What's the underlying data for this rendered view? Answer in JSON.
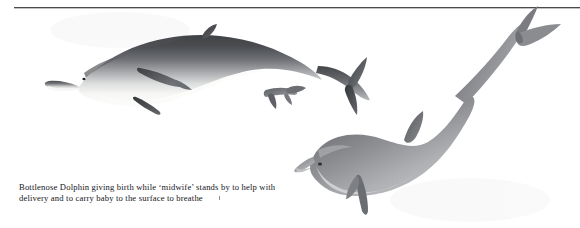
{
  "page": {
    "background_color": "#ffffff",
    "width": 580,
    "height": 228,
    "kind": "book-illustration-plate"
  },
  "rule": {
    "name": "horizontal-rule",
    "color": "#4a4a4a"
  },
  "caption": {
    "line1": "Bottlenose Dolphin giving birth while ‘midwife’ stands by to help with",
    "line2": "delivery and to carry baby to the surface to breathe",
    "full_text": "Bottlenose Dolphin giving birth while ‘midwife’ stands by to help with delivery and to carry baby to the surface to breathe",
    "text_color": "#15161a"
  },
  "illustration": {
    "title": "Bottlenose Dolphin birth with attending midwife dolphin",
    "medium": "airbrush / graphite grey-scale wildlife illustration",
    "subjects": [
      {
        "name": "mother-dolphin",
        "label": "Bottlenose Dolphin giving birth",
        "orientation": "horizontal, head to the left, back arched upward, tail to the right",
        "body_top_color": "#4f5054",
        "body_mid_color": "#8e9094",
        "belly_color": "#fbfbfa",
        "fin_color": "#3f4043",
        "features": [
          "beak",
          "eye",
          "melon",
          "dorsal-fin",
          "two-pectoral-flippers",
          "tail-fluke",
          "white-belly"
        ]
      },
      {
        "name": "baby-dolphin",
        "label": "baby emerging tail-first",
        "orientation": "tail flukes protruding from mother's underside",
        "body_color": "#6f7176",
        "features": [
          "tail-flukes"
        ]
      },
      {
        "name": "midwife-dolphin",
        "label": "'midwife' dolphin standing by",
        "orientation": "diagonal, head at lower left, body rising to upper right, tail fluke at top right",
        "body_top_color": "#6f7175",
        "body_mid_color": "#97999d",
        "belly_color": "#cfd1d3",
        "fin_color": "#5d5f63",
        "features": [
          "beak",
          "eye",
          "melon",
          "dorsal-fin",
          "pectoral-flipper",
          "tail-fluke"
        ]
      }
    ]
  }
}
